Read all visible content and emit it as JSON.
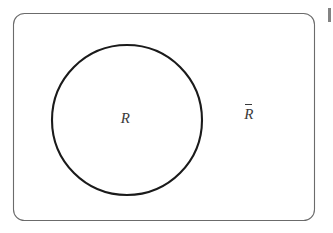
{
  "figure": {
    "type": "venn-diagram",
    "title": "",
    "background_color": "#ffffff"
  },
  "universe": {
    "shape": "rounded-rectangle",
    "stroke_color": "#6b6b6b",
    "stroke_width": 1,
    "corner_radius": 11,
    "bounds": {
      "x": 13,
      "y": 13,
      "width": 302,
      "height": 208
    }
  },
  "set_circle": {
    "shape": "circle",
    "stroke_color": "#1a1a1a",
    "stroke_width": 2,
    "center_x": 127,
    "center_y": 120,
    "radius": 75,
    "fill": "none"
  },
  "labels": {
    "inside": {
      "text": "R",
      "meaning": "set-R",
      "color": "#3a3a3a",
      "x": 125,
      "y": 118
    },
    "outside": {
      "text": "R",
      "overbar": true,
      "meaning": "complement-of-R",
      "color": "#3a3a3a",
      "x": 249,
      "y": 118
    }
  },
  "artifact": {
    "present": true,
    "description": "scan-edge-mark",
    "color": "#6d6d6d"
  }
}
